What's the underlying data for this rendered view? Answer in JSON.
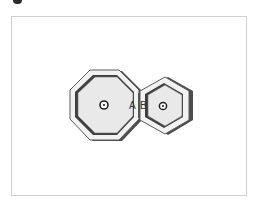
{
  "figure": {
    "corner_marker": "figure-index-mark",
    "frame_color": "#cfcfcf",
    "background": "#ffffff"
  },
  "shapes": {
    "octagon": {
      "name": "gear-a",
      "center_icon": "center-point-icon",
      "fill": "#e8e8e8",
      "shadow": "#555555",
      "rim": "#f4f4f4",
      "stroke": "#444444"
    },
    "hexagon": {
      "name": "gear-b",
      "center_icon": "center-point-icon",
      "fill": "#e8e8e8",
      "shadow": "#555555",
      "rim": "#f4f4f4",
      "stroke": "#444444"
    }
  },
  "labels": {
    "a": "A",
    "b": "B"
  }
}
